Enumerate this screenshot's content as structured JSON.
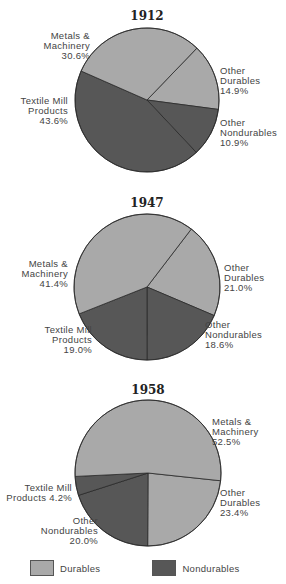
{
  "colors": {
    "durables": "#a9a9a9",
    "nondurables": "#575757",
    "outline": "#2a2a2a"
  },
  "legend": [
    {
      "label": "Durables",
      "color": "#a9a9a9"
    },
    {
      "label": "Nondurables",
      "color": "#575757"
    }
  ],
  "chart_data": [
    {
      "type": "pie",
      "title": "1912",
      "center": [
        147,
        100
      ],
      "radius": 72,
      "start_angle": 43.9,
      "slices": [
        {
          "name": "Other Durables",
          "lines": [
            "Other",
            "Durables",
            "14.9%"
          ],
          "value": 14.9,
          "group": "Durables",
          "label_anchor": "start",
          "label_pos": [
            220,
            74
          ]
        },
        {
          "name": "Other Nondurables",
          "lines": [
            "Other",
            "Nondurables",
            "10.9%"
          ],
          "value": 10.9,
          "group": "Nondurables",
          "label_anchor": "start",
          "label_pos": [
            220,
            126
          ]
        },
        {
          "name": "Textile Mill Products",
          "lines": [
            "Textile Mill",
            "Products",
            "43.6%"
          ],
          "value": 43.6,
          "group": "Nondurables",
          "label_anchor": "end",
          "label_pos": [
            68,
            104
          ]
        },
        {
          "name": "Metals & Machinery",
          "lines": [
            "Metals &",
            "Machinery",
            "30.6%"
          ],
          "value": 30.6,
          "group": "Durables",
          "label_anchor": "end",
          "label_pos": [
            90,
            39
          ]
        }
      ]
    },
    {
      "type": "pie",
      "title": "1947",
      "center": [
        147,
        287
      ],
      "radius": 73,
      "start_angle": 37.4,
      "slices": [
        {
          "name": "Other Durables",
          "lines": [
            "Other",
            "Durables",
            "21.0%"
          ],
          "value": 21.0,
          "group": "Durables",
          "label_anchor": "start",
          "label_pos": [
            224,
            271
          ]
        },
        {
          "name": "Other Nondurables",
          "lines": [
            "Other",
            "Nondurables",
            "18.6%"
          ],
          "value": 18.6,
          "group": "Nondurables",
          "label_anchor": "start",
          "label_pos": [
            205,
            328
          ]
        },
        {
          "name": "Textile Mill Products",
          "lines": [
            "Textile Mill",
            "Products",
            "19.0%"
          ],
          "value": 19.0,
          "group": "Nondurables",
          "label_anchor": "end",
          "label_pos": [
            92,
            333
          ]
        },
        {
          "name": "Metals & Machinery",
          "lines": [
            "Metals &",
            "Machinery",
            "41.4%"
          ],
          "value": 41.4,
          "group": "Durables",
          "label_anchor": "end",
          "label_pos": [
            68,
            267
          ]
        }
      ]
    },
    {
      "type": "pie",
      "title": "1958",
      "center": [
        148,
        473
      ],
      "radius": 73,
      "start_angle": 96.1,
      "slices": [
        {
          "name": "Other Durables",
          "lines": [
            "Other",
            "Durables",
            "23.4%"
          ],
          "value": 23.4,
          "group": "Durables",
          "label_anchor": "start",
          "label_pos": [
            220,
            496
          ]
        },
        {
          "name": "Other Nondurables",
          "lines": [
            "Other",
            "Nondurables",
            "20.0%"
          ],
          "value": 20.0,
          "group": "Nondurables",
          "label_anchor": "end",
          "label_pos": [
            98,
            524
          ]
        },
        {
          "name": "Textile Mill Products",
          "lines": [
            "Textile Mill",
            "Products 4.2%"
          ],
          "value": 4.2,
          "group": "Nondurables",
          "label_anchor": "end",
          "label_pos": [
            72,
            491
          ]
        },
        {
          "name": "Metals & Machinery",
          "lines": [
            "Metals &",
            "Machinery",
            "52.5%"
          ],
          "value": 52.5,
          "group": "Durables",
          "label_anchor": "start",
          "label_pos": [
            212,
            425
          ]
        }
      ]
    }
  ]
}
